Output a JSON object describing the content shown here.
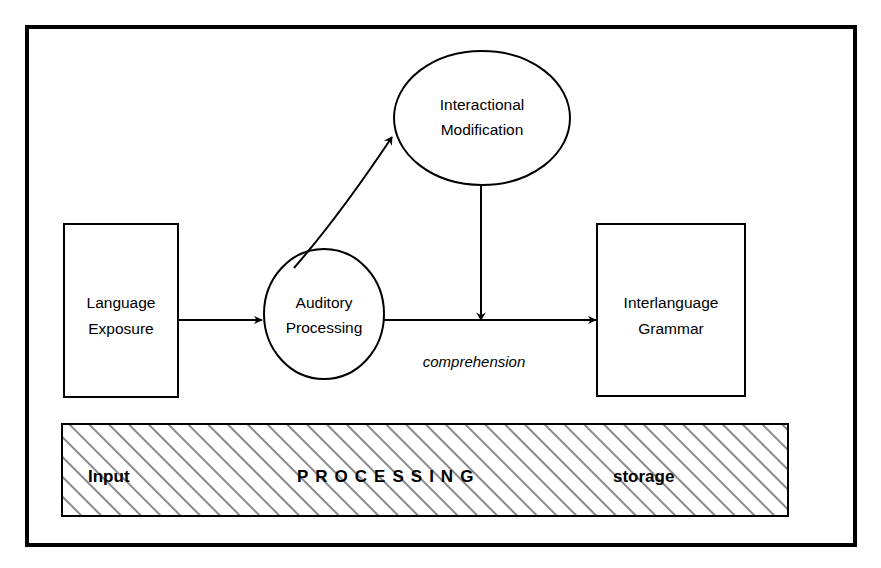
{
  "figure": {
    "kind": "process-flow-diagram",
    "background_color": "#ffffff",
    "stroke_color": "#000000"
  },
  "nodes": {
    "language_exposure": {
      "shape": "rectangle",
      "line1": "Language",
      "line2": "Exposure"
    },
    "auditory_processing": {
      "shape": "ellipse",
      "line1": "Auditory",
      "line2": "Processing"
    },
    "interactional_modification": {
      "shape": "ellipse",
      "line1": "Interactional",
      "line2": "Modification"
    },
    "interlanguage_grammar": {
      "shape": "rectangle",
      "line1": "Interlanguage",
      "line2": "Grammar"
    }
  },
  "edges": {
    "exposure_to_auditory": {
      "label": ""
    },
    "auditory_to_interactional": {
      "label": ""
    },
    "interactional_to_flow": {
      "label": ""
    },
    "auditory_to_grammar": {
      "label": "comprehension"
    }
  },
  "band": {
    "fill_pattern": "diagonal-hatch",
    "labels": [
      {
        "text": "Input",
        "style": "bold"
      },
      {
        "text": "PROCESSING",
        "style": "bold-wide"
      },
      {
        "text": "storage",
        "style": "bold"
      }
    ]
  }
}
